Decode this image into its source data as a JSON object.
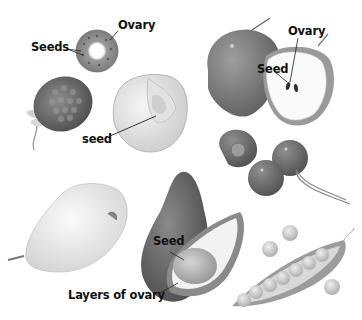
{
  "figure": {
    "fruits": [
      {
        "name": "orange-cross-section",
        "labels": [
          "Seeds",
          "Ovary"
        ]
      },
      {
        "name": "raspberry",
        "labels": []
      },
      {
        "name": "peach",
        "labels": [
          "seed"
        ]
      },
      {
        "name": "apple",
        "labels": [
          "Ovary",
          "Seed"
        ]
      },
      {
        "name": "cherries",
        "labels": []
      },
      {
        "name": "pear",
        "labels": []
      },
      {
        "name": "avocado",
        "labels": [
          "Seed",
          "Layers of ovary"
        ]
      },
      {
        "name": "pea-pod",
        "labels": []
      }
    ]
  },
  "labels": {
    "orange_seeds": "Seeds",
    "orange_ovary": "Ovary",
    "peach_seed": "seed",
    "apple_ovary": "Ovary",
    "apple_seed": "Seed",
    "avocado_seed": "Seed",
    "avocado_layers": "Layers of ovary"
  },
  "colors": {
    "background": "#ffffff",
    "label_text": "#111111"
  }
}
